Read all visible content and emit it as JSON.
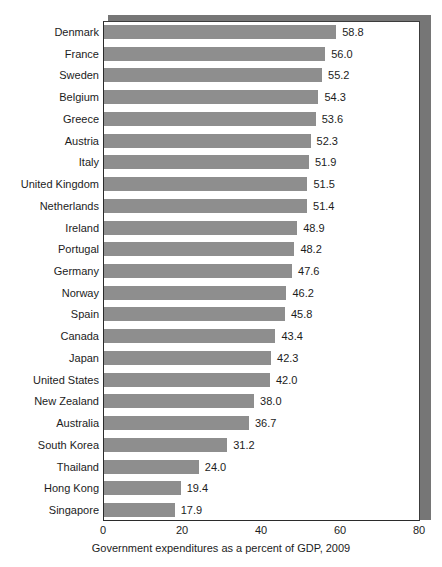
{
  "chart_data": {
    "type": "bar",
    "orientation": "horizontal",
    "title": "",
    "xlabel": "Government expenditures as a percent of GDP, 2009",
    "ylabel": "",
    "xlim": [
      0,
      80
    ],
    "xticks": [
      0,
      20,
      40,
      60,
      80
    ],
    "xtick_labels": [
      "0",
      "20",
      "40",
      "60",
      "80"
    ],
    "grid": false,
    "legend": null,
    "bar_color": "#8e8e8e",
    "categories": [
      "Denmark",
      "France",
      "Sweden",
      "Belgium",
      "Greece",
      "Austria",
      "Italy",
      "United Kingdom",
      "Netherlands",
      "Ireland",
      "Portugal",
      "Germany",
      "Norway",
      "Spain",
      "Canada",
      "Japan",
      "United States",
      "New Zealand",
      "Australia",
      "South Korea",
      "Thailand",
      "Hong Kong",
      "Singapore"
    ],
    "values": [
      58.8,
      56.0,
      55.2,
      54.3,
      53.6,
      52.3,
      51.9,
      51.5,
      51.4,
      48.9,
      48.2,
      47.6,
      46.2,
      45.8,
      43.4,
      42.3,
      42.0,
      38.0,
      36.7,
      31.2,
      24.0,
      19.4,
      17.9
    ],
    "value_labels": [
      "58.8",
      "56.0",
      "55.2",
      "54.3",
      "53.6",
      "52.3",
      "51.9",
      "51.5",
      "51.4",
      "48.9",
      "48.2",
      "47.6",
      "46.2",
      "45.8",
      "43.4",
      "42.3",
      "42.0",
      "38.0",
      "36.7",
      "31.2",
      "24.0",
      "19.4",
      "17.9"
    ]
  }
}
